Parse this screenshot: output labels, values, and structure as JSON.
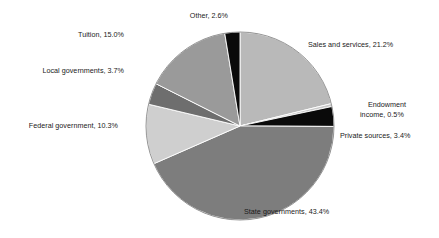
{
  "chart_data": {
    "type": "pie",
    "title": "",
    "categories": [
      "Sales and services",
      "Endowment income",
      "Private sources",
      "State governments",
      "Federal government",
      "Local governments",
      "Tuition",
      "Other"
    ],
    "values": [
      21.2,
      0.5,
      3.4,
      43.4,
      10.3,
      3.7,
      15.0,
      2.6
    ],
    "unit": "%",
    "start_angle_deg": 0,
    "direction": "clockwise",
    "legend": "none",
    "grid": false,
    "slice_colors": [
      "#b9b9b9",
      "#c9c9c9",
      "#0a0a0a",
      "#7d7d7d",
      "#cfcfcf",
      "#6e6e6e",
      "#9a9a9a",
      "#0a0a0a"
    ],
    "labels": [
      {
        "text": "Sales and services, 21.2%",
        "lines": [
          "Sales and services, 21.2%"
        ]
      },
      {
        "text": "Endowment income, 0.5%",
        "lines": [
          "Endowment",
          "income, 0.5%"
        ]
      },
      {
        "text": "Private sources, 3.4%",
        "lines": [
          "Private sources, 3.4%"
        ]
      },
      {
        "text": "State governments, 43.4%",
        "lines": [
          "State governments, 43.4%"
        ]
      },
      {
        "text": "Federal government, 10.3%",
        "lines": [
          "Federal government, 10.3%"
        ]
      },
      {
        "text": "Local governments, 3.7%",
        "lines": [
          "Local governments, 3.7%"
        ]
      },
      {
        "text": "Tuition, 15.0%",
        "lines": [
          "Tuition, 15.0%"
        ]
      },
      {
        "text": "Other, 2.6%",
        "lines": [
          "Other, 2.6%"
        ]
      }
    ]
  },
  "labels_display": {
    "other": "Other, 2.6%",
    "tuition": "Tuition, 15.0%",
    "local_governments": "Local governments, 3.7%",
    "federal_government": "Federal government, 10.3%",
    "state_governments": "State governments, 43.4%",
    "sales_and_services": "Sales and services, 21.2%",
    "endowment_line1": "Endowment",
    "endowment_line2": "income, 0.5%",
    "private_sources": "Private sources, 3.4%"
  }
}
